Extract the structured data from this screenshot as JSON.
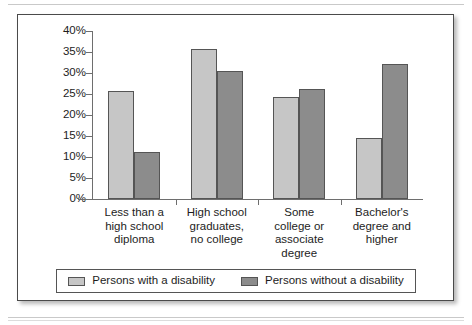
{
  "chart_data": {
    "type": "bar",
    "title": "",
    "subtitle": "",
    "xlabel": "",
    "ylabel": "",
    "ylim": [
      0,
      40
    ],
    "ytick_labels": [
      "0%",
      "5%",
      "10%",
      "15%",
      "20%",
      "25%",
      "30%",
      "35%",
      "40%"
    ],
    "ytick_values": [
      0,
      5,
      10,
      15,
      20,
      25,
      30,
      35,
      40
    ],
    "grid": false,
    "legend_position": "bottom",
    "categories": [
      "Less than a\nhigh school\ndiploma",
      "High school\ngraduates,\nno college",
      "Some\ncollege or\nassociate\ndegree",
      "Bachelor's\ndegree and\nhigher"
    ],
    "category_lines": [
      [
        "Less than a",
        "high school",
        "diploma"
      ],
      [
        "High school",
        "graduates,",
        "no college"
      ],
      [
        "Some",
        "college or",
        "associate",
        "degree"
      ],
      [
        "Bachelor's",
        "degree and",
        "higher"
      ]
    ],
    "series": [
      {
        "name": "Persons with a disability",
        "color": "#c6c6c6",
        "values": [
          25.8,
          35.8,
          24.2,
          14.5
        ]
      },
      {
        "name": "Persons without a disability",
        "color": "#8c8c8c",
        "values": [
          11.2,
          30.5,
          26.3,
          32.2
        ]
      }
    ]
  },
  "legend": {
    "entries": [
      {
        "label": "Persons with a disability",
        "swatch": "light"
      },
      {
        "label": "Persons without a disability",
        "swatch": "dark"
      }
    ]
  },
  "colors": {
    "series_light": "#c6c6c6",
    "series_dark": "#8c8c8c",
    "axis": "#6e6e6e",
    "frame": "#4a4a4a",
    "text": "#1d1d1d"
  }
}
